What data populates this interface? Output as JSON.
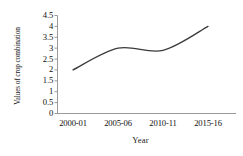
{
  "chart_data": {
    "type": "line",
    "title": "",
    "xlabel": "Year",
    "ylabel": "Values of crop combination",
    "categories": [
      "2000-01",
      "2005-06",
      "2010-11",
      "2015-16"
    ],
    "series": [
      {
        "name": "Values of crop combination",
        "values": [
          2,
          3,
          2.9,
          4
        ],
        "color": "#3a3a3a",
        "smooth": true,
        "markers": false,
        "line_width": 1.3
      }
    ],
    "ylim": [
      0,
      4.5
    ],
    "y_ticks": [
      "0",
      "0.5",
      "1",
      "1.5",
      "2",
      "2.5",
      "3",
      "3.5",
      "4",
      "4.5"
    ],
    "y_tick_values": [
      0,
      0.5,
      1,
      1.5,
      2,
      2.5,
      3,
      3.5,
      4,
      4.5
    ],
    "x_tick_labels": [
      "2000-01",
      "2005-06",
      "2010-11",
      "2015-16"
    ],
    "grid": false,
    "legend": false,
    "legend_position": "none",
    "axis_color": "#9a9a9a",
    "background": "#ffffff"
  },
  "axes": {
    "y_title": "Values of crop combination",
    "x_title": "Year"
  }
}
